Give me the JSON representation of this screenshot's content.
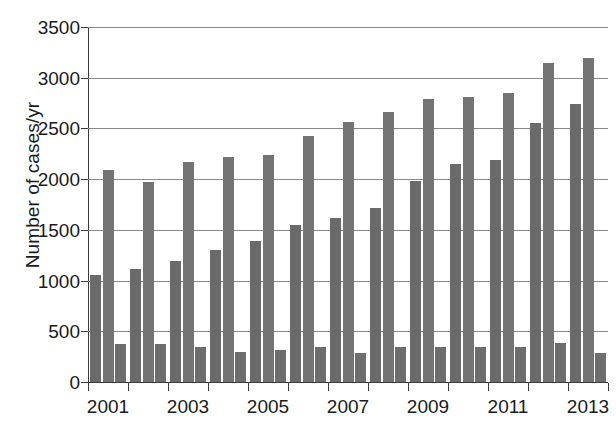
{
  "chart_data": {
    "type": "bar",
    "title": "",
    "xlabel": "",
    "ylabel": "Number of cases/yr",
    "ylim": [
      0,
      3500
    ],
    "ytick_labels": [
      "0",
      "500",
      "1000",
      "1500",
      "2000",
      "2500",
      "3000",
      "3500"
    ],
    "ytick_values": [
      0,
      500,
      1000,
      1500,
      2000,
      2500,
      3000,
      3500
    ],
    "grid": true,
    "legend": "none",
    "bar_color": "#6f6f6f",
    "categories": [
      "2001",
      "2002",
      "2003",
      "2004",
      "2005",
      "2006",
      "2007",
      "2008",
      "2009",
      "2010",
      "2011",
      "2012",
      "2013"
    ],
    "xtick_labels": [
      "2001",
      "",
      "2003",
      "",
      "2005",
      "",
      "2007",
      "",
      "2009",
      "",
      "2011",
      "",
      "2013"
    ],
    "series": [
      {
        "name": "series-1",
        "color": "#6a6a6a",
        "values": [
          1060,
          1110,
          1195,
          1300,
          1395,
          1545,
          1620,
          1720,
          1980,
          2150,
          2185,
          2555,
          2740
        ]
      },
      {
        "name": "series-2",
        "color": "#737373",
        "values": [
          2090,
          1975,
          2170,
          2215,
          2240,
          2430,
          2560,
          2660,
          2790,
          2810,
          2845,
          3145,
          3195
        ]
      },
      {
        "name": "series-3",
        "color": "#6d6d6d",
        "values": [
          375,
          370,
          350,
          300,
          320,
          345,
          285,
          350,
          345,
          350,
          350,
          380,
          290
        ]
      }
    ]
  }
}
